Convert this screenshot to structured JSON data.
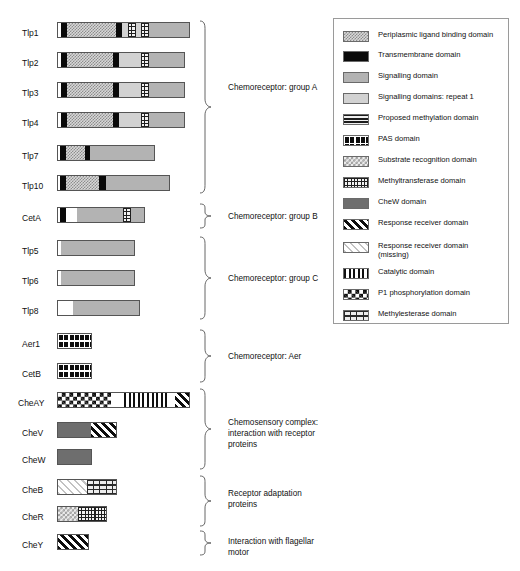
{
  "proteins": [
    {
      "name": "Tlp1",
      "group": "A"
    },
    {
      "name": "Tlp2",
      "group": "A"
    },
    {
      "name": "Tlp3",
      "group": "A"
    },
    {
      "name": "Tlp4",
      "group": "A"
    },
    {
      "name": "Tlp7",
      "group": "A"
    },
    {
      "name": "Tlp10",
      "group": "A"
    },
    {
      "name": "CetA",
      "group": "B"
    },
    {
      "name": "Tlp5",
      "group": "C"
    },
    {
      "name": "Tlp6",
      "group": "C"
    },
    {
      "name": "Tlp8",
      "group": "C"
    },
    {
      "name": "Aer1",
      "group": "Aer"
    },
    {
      "name": "CetB",
      "group": "Aer"
    },
    {
      "name": "CheAY",
      "group": "complex"
    },
    {
      "name": "CheV",
      "group": "complex"
    },
    {
      "name": "CheW",
      "group": "complex"
    },
    {
      "name": "CheB",
      "group": "adaptation"
    },
    {
      "name": "CheR",
      "group": "adaptation"
    },
    {
      "name": "CheY",
      "group": "flagellar"
    }
  ],
  "groups": [
    {
      "id": "A",
      "label": "Chemoreceptor: group A"
    },
    {
      "id": "B",
      "label": "Chemoreceptor: group B"
    },
    {
      "id": "C",
      "label": "Chemoreceptor: group C"
    },
    {
      "id": "Aer",
      "label": "Chemoreceptor: Aer"
    },
    {
      "id": "complex",
      "label": "Chemosensory complex:\ninteraction with receptor\nproteins"
    },
    {
      "id": "adaptation",
      "label": "Receptor adaptation\nproteins"
    },
    {
      "id": "flagellar",
      "label": "Interaction with flagellar\nmotor"
    }
  ],
  "legend": {
    "items": [
      {
        "key": "periplasmic",
        "label": "Periplasmic ligand binding domain"
      },
      {
        "key": "transmembrane",
        "label": "Transmembrane domain"
      },
      {
        "key": "signalling",
        "label": "Signalling domain"
      },
      {
        "key": "signalling_repeat",
        "label": "Signalling domains: repeat 1"
      },
      {
        "key": "methylation",
        "label": "Proposed methylation domain"
      },
      {
        "key": "pas",
        "label": "PAS domain"
      },
      {
        "key": "substrate",
        "label": "Substrate recognition domain"
      },
      {
        "key": "methyltransferase",
        "label": "Methyltransferase domain"
      },
      {
        "key": "chew",
        "label": "CheW domain"
      },
      {
        "key": "response_receiver",
        "label": "Response receiver domain"
      },
      {
        "key": "response_missing",
        "label": "Response receiver domain\n(missing)"
      },
      {
        "key": "catalytic",
        "label": "Catalytic domain"
      },
      {
        "key": "p1",
        "label": "P1 phosphorylation domain"
      },
      {
        "key": "methylesterase",
        "label": "Methylesterase domain"
      }
    ]
  },
  "colors": {
    "transmembrane": "#0a0a0a",
    "signalling": "#b3b3b3",
    "signalling_repeat": "#d2d2d2",
    "chew": "#6e6e6e",
    "outline": "#555555",
    "legend_border": "#9a9a9a",
    "text": "#111111"
  }
}
